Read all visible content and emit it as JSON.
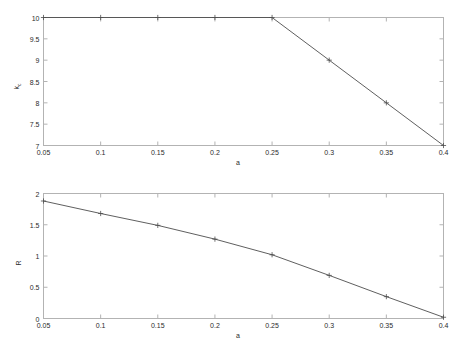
{
  "figure": {
    "background_color": "#ffffff",
    "axis_color": "#b3b3b3",
    "line_color": "#4d4d4d",
    "text_color": "#2b2b2b",
    "marker": "plus"
  },
  "chart_data": [
    {
      "type": "line",
      "id": "top-panel",
      "title": "",
      "xlabel": "a",
      "ylabel": "k",
      "ylabel_sub": "c",
      "ylabel_full": "k_c",
      "x": [
        0.05,
        0.1,
        0.15,
        0.2,
        0.25,
        0.3,
        0.35,
        0.4
      ],
      "values": [
        10,
        10,
        10,
        10,
        10,
        9,
        8,
        7
      ],
      "xlim": [
        0.05,
        0.4
      ],
      "ylim": [
        7,
        10
      ],
      "xticks": [
        0.05,
        0.1,
        0.15,
        0.2,
        0.25,
        0.3,
        0.35,
        0.4
      ],
      "xticklabels": [
        "0.05",
        "0.1",
        "0.15",
        "0.2",
        "0.25",
        "0.3",
        "0.35",
        "0.4"
      ],
      "yticks": [
        7,
        7.5,
        8,
        8.5,
        9,
        9.5,
        10
      ],
      "yticklabels": [
        "7",
        "7.5",
        "8",
        "8.5",
        "9",
        "9.5",
        "10"
      ],
      "grid": false,
      "legend": false,
      "series": [
        {
          "name": "k_c",
          "values": [
            10,
            10,
            10,
            10,
            10,
            9,
            8,
            7
          ]
        }
      ]
    },
    {
      "type": "line",
      "id": "bottom-panel",
      "title": "",
      "xlabel": "a",
      "ylabel": "R",
      "ylabel_sub": "",
      "ylabel_full": "R",
      "x": [
        0.05,
        0.1,
        0.15,
        0.2,
        0.25,
        0.3,
        0.35,
        0.4
      ],
      "values": [
        1.88,
        1.68,
        1.49,
        1.27,
        1.02,
        0.69,
        0.35,
        0.02
      ],
      "xlim": [
        0.05,
        0.4
      ],
      "ylim": [
        0,
        2
      ],
      "xticks": [
        0.05,
        0.1,
        0.15,
        0.2,
        0.25,
        0.3,
        0.35,
        0.4
      ],
      "xticklabels": [
        "0.05",
        "0.1",
        "0.15",
        "0.2",
        "0.25",
        "0.3",
        "0.35",
        "0.4"
      ],
      "yticks": [
        0,
        0.5,
        1,
        1.5,
        2
      ],
      "yticklabels": [
        "0",
        "0.5",
        "1",
        "1.5",
        "2"
      ],
      "grid": false,
      "legend": false,
      "series": [
        {
          "name": "R",
          "values": [
            1.88,
            1.68,
            1.49,
            1.27,
            1.02,
            0.69,
            0.35,
            0.02
          ]
        }
      ]
    }
  ]
}
